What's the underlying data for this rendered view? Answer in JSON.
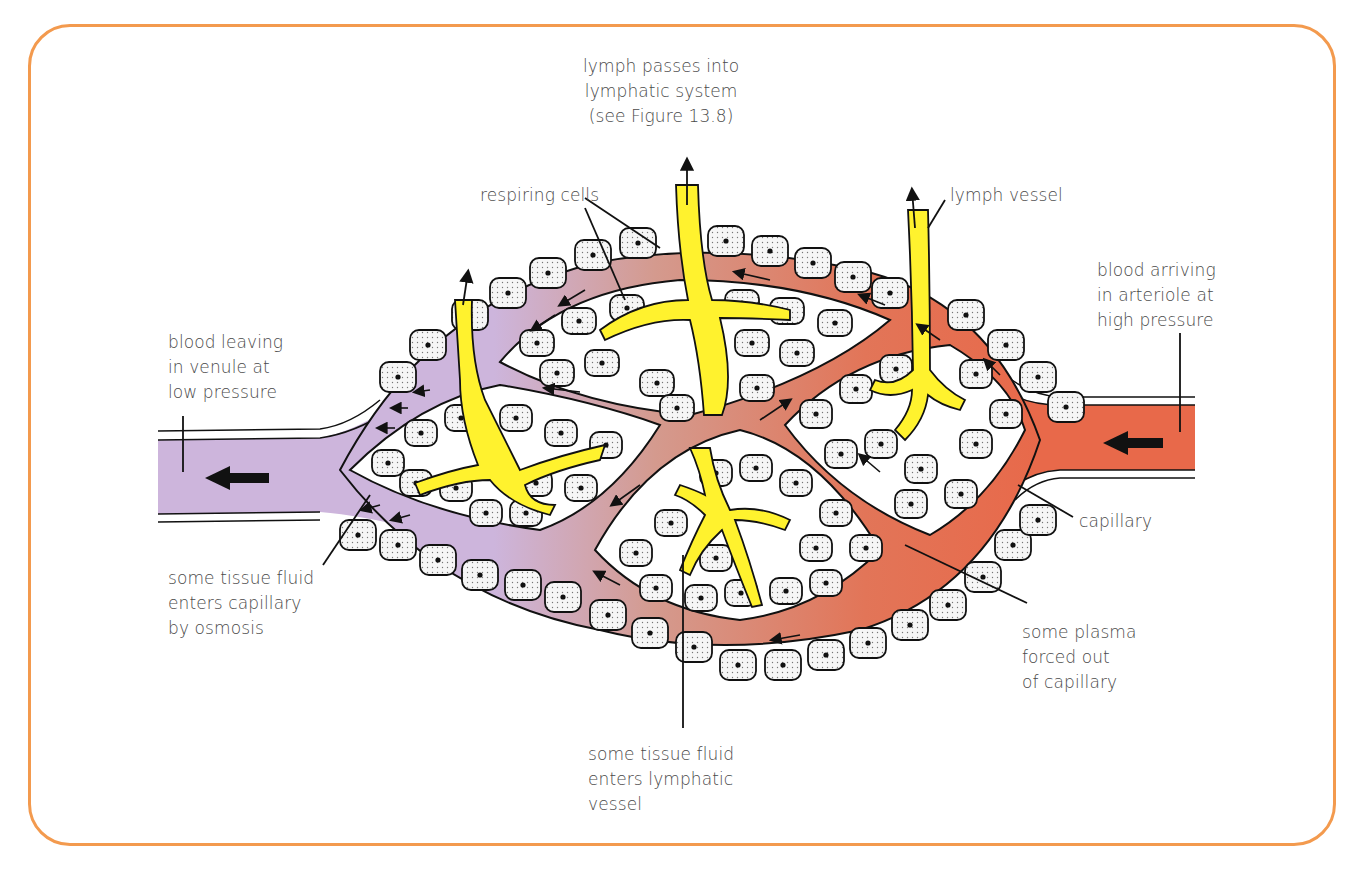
{
  "figure": {
    "colors": {
      "frame": "#F39A4E",
      "arteriole_blood": "#E8694A",
      "capillary_mid_blood": "#D9907F",
      "venule_blood": "#CDB5DC",
      "lymph": "#FFF22E",
      "cell_fill": "#F4F4F4",
      "outline": "#111111",
      "label_text": "#4a4a4a"
    },
    "labels": {
      "lymph_passes": {
        "text": "lymph passes into\nlymphatic system\n(see Figure 13.8)",
        "x": 583,
        "y": 54
      },
      "respiring_cells": {
        "text": "respiring cells",
        "x": 480,
        "y": 183
      },
      "lymph_vessel": {
        "text": "lymph vessel",
        "x": 950,
        "y": 183
      },
      "blood_arriving": {
        "text": "blood arriving\nin arteriole at\nhigh pressure",
        "x": 1097,
        "y": 258
      },
      "blood_leaving": {
        "text": "blood leaving\nin venule at\nlow pressure",
        "x": 168,
        "y": 330
      },
      "capillary": {
        "text": "capillary",
        "x": 1079,
        "y": 509
      },
      "tissue_fluid_osmosis": {
        "text": "some tissue fluid\nenters capillary\nby osmosis",
        "x": 168,
        "y": 566
      },
      "plasma_forced": {
        "text": "some plasma\nforced out\nof capillary",
        "x": 1022,
        "y": 620
      },
      "tissue_fluid_lymph": {
        "text": "some tissue fluid\nenters lymphatic\nvessel",
        "x": 588,
        "y": 742
      }
    },
    "leader_lines": [
      {
        "name": "respiring-cells-leader-1",
        "x1": 585,
        "y1": 198,
        "x2": 660,
        "y2": 248
      },
      {
        "name": "respiring-cells-leader-2",
        "x1": 585,
        "y1": 208,
        "x2": 625,
        "y2": 300
      },
      {
        "name": "lymph-vessel-leader",
        "x1": 945,
        "y1": 200,
        "x2": 928,
        "y2": 228
      },
      {
        "name": "arteriole-leader",
        "x1": 1180,
        "y1": 333,
        "x2": 1180,
        "y2": 432
      },
      {
        "name": "venule-leader",
        "x1": 183,
        "y1": 416,
        "x2": 183,
        "y2": 472
      },
      {
        "name": "capillary-leader",
        "x1": 1073,
        "y1": 517,
        "x2": 1018,
        "y2": 485
      },
      {
        "name": "osmosis-leader",
        "x1": 323,
        "y1": 565,
        "x2": 370,
        "y2": 495
      },
      {
        "name": "plasma-leader",
        "x1": 1027,
        "y1": 603,
        "x2": 905,
        "y2": 545
      },
      {
        "name": "lymph-entry-leader",
        "x1": 683,
        "y1": 728,
        "x2": 683,
        "y2": 555
      }
    ],
    "flow_arrows": {
      "venule_main": {
        "x": 268,
        "y": 478,
        "dir": "left"
      },
      "arteriole_main": {
        "x": 1162,
        "y": 443,
        "dir": "left"
      }
    },
    "caption": ""
  }
}
